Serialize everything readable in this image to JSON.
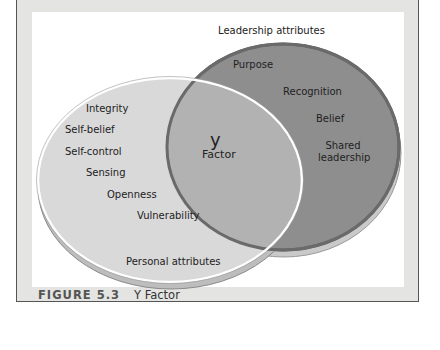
{
  "figure": {
    "number": "FIGURE 5.3",
    "title": "Y Factor"
  },
  "diagram": {
    "type": "venn",
    "leadership_set": {
      "label": "Leadership attributes",
      "items": [
        "Purpose",
        "Recognition",
        "Belief",
        "Shared leadership"
      ],
      "fill": "#8e8e8e"
    },
    "personal_set": {
      "label": "Personal attributes",
      "items": [
        "Integrity",
        "Self-belief",
        "Self-control",
        "Sensing",
        "Openness",
        "Vulnerability"
      ],
      "fill": "#d9d9d9"
    },
    "intersection": {
      "symbol": "y",
      "label": "Factor",
      "fill": "#b2b2b2"
    }
  },
  "labels": {
    "leadership": "Leadership attributes",
    "personal": "Personal attributes",
    "purpose": "Purpose",
    "recognition": "Recognition",
    "belief": "Belief",
    "shared1": "Shared",
    "shared2": "leadership",
    "integrity": "Integrity",
    "selfbelief": "Self-belief",
    "selfcontrol": "Self-control",
    "sensing": "Sensing",
    "openness": "Openness",
    "vulnerability": "Vulnerability",
    "y": "y",
    "factor": "Factor"
  }
}
